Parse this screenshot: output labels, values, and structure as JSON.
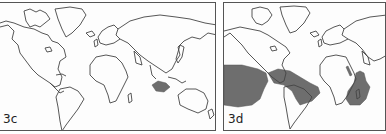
{
  "figure": {
    "panels": [
      {
        "id": "3c",
        "label": "3c",
        "projection": "mercator-world-outline",
        "shaded_regions": [
          "Java / Lesser Sunda Islands (Indonesia)"
        ]
      },
      {
        "id": "3d",
        "label": "3d",
        "projection": "mercator-world-outline",
        "shaded_regions": [
          "Eastern tropical Pacific Ocean",
          "Caribbean Sea / Gulf of Mexico",
          "Western tropical Atlantic off Brazil",
          "Red Sea",
          "Western Indian Ocean off East Africa / Madagascar"
        ]
      }
    ],
    "colors": {
      "coastline": "#444444",
      "shading": "#6e6e6e",
      "border": "#555555",
      "background": "#fdfdfd"
    }
  }
}
